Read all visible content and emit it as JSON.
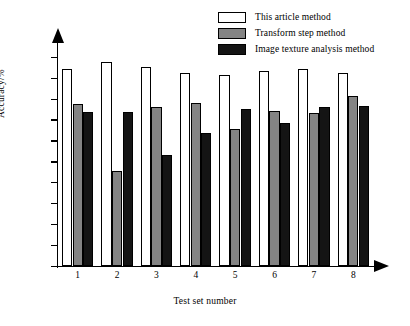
{
  "chart_data": {
    "type": "bar",
    "title": "",
    "xlabel": "Test set number",
    "ylabel": "Accuracy/%",
    "categories": [
      "1",
      "2",
      "3",
      "4",
      "5",
      "6",
      "7",
      "8"
    ],
    "ylim": [
      95,
      100
    ],
    "yticks": [
      "100",
      "99.5",
      "99",
      "98.5",
      "98",
      "97.5",
      "97",
      "96.5",
      "96",
      "95.5",
      "95"
    ],
    "ytick_values": [
      100,
      99.5,
      99,
      98.5,
      98,
      97.5,
      97,
      96.5,
      96,
      95.5,
      95
    ],
    "grid": false,
    "legend_position": "top-right",
    "series": [
      {
        "name": "This article method",
        "color": "#ffffff",
        "values": [
          99.7,
          99.87,
          99.76,
          99.61,
          99.56,
          99.65,
          99.7,
          99.61
        ]
      },
      {
        "name": "Transform step method",
        "color": "#848484",
        "values": [
          98.86,
          97.27,
          98.79,
          98.89,
          98.27,
          98.7,
          98.66,
          99.07
        ]
      },
      {
        "name": "Image texture analysis method",
        "color": "#141414",
        "values": [
          98.67,
          98.67,
          97.66,
          98.17,
          98.76,
          98.42,
          98.8,
          98.83
        ]
      }
    ]
  },
  "legend": {
    "items": [
      {
        "label": "This article method",
        "swatch": "white-swatch"
      },
      {
        "label": "Transform step method",
        "swatch": "gray-swatch"
      },
      {
        "label": "Image texture analysis method",
        "swatch": "black-swatch"
      }
    ]
  },
  "axes": {
    "y_title": "Accuracy/%",
    "x_title": "Test set number"
  }
}
